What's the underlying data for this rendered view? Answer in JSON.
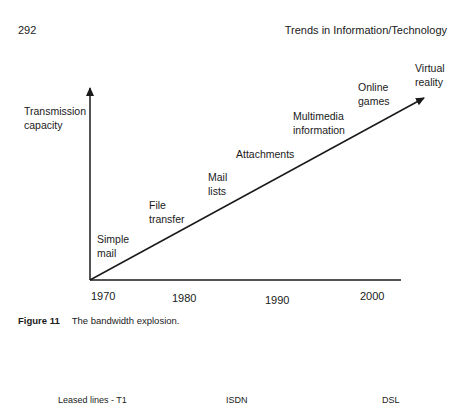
{
  "page": {
    "number": "292",
    "running_head": "Trends in Information/Technology"
  },
  "figure": {
    "label": "Figure 11",
    "caption": "The bandwidth explosion.",
    "y_axis_label_line1": "Transmission",
    "y_axis_label_line2": "capacity",
    "x_ticks": [
      "1970",
      "1980",
      "1990",
      "2000"
    ],
    "milestones": [
      {
        "line1": "Simple",
        "line2": "mail"
      },
      {
        "line1": "File",
        "line2": "transfer"
      },
      {
        "line1": "Mail",
        "line2": "lists"
      },
      {
        "line1": "Attachments",
        "line2": ""
      },
      {
        "line1": "Multimedia",
        "line2": "information"
      },
      {
        "line1": "Online",
        "line2": "games"
      },
      {
        "line1": "Virtual",
        "line2": "reality"
      }
    ]
  },
  "bottom_labels": [
    "Leased lines - T1",
    "ISDN",
    "DSL"
  ],
  "colors": {
    "ink": "#1a1a1a",
    "background": "#ffffff"
  }
}
